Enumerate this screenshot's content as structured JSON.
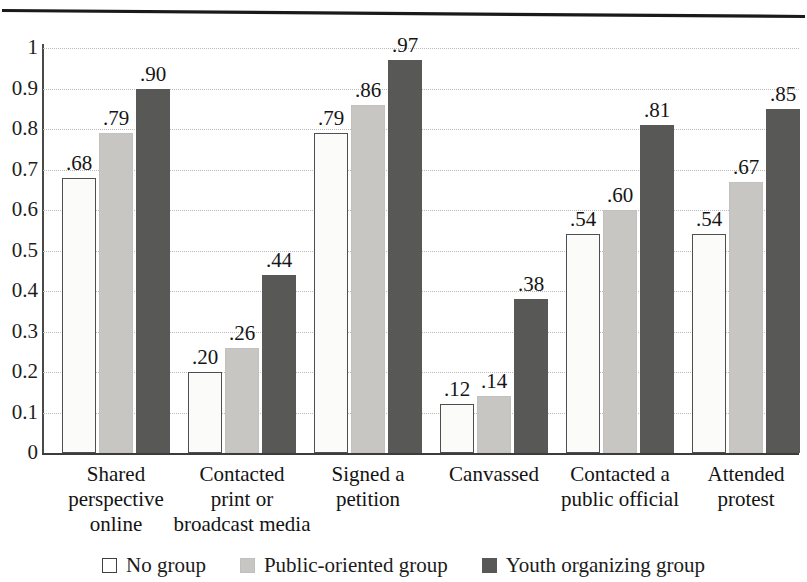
{
  "chart_data": {
    "type": "bar",
    "title": "",
    "subtitle": "",
    "xlabel": "",
    "ylabel": "",
    "ylim": [
      0,
      1
    ],
    "grid": true,
    "legend_position": "bottom",
    "categories": [
      "Shared perspective online",
      "Contacted print or broadcast media",
      "Signed a petition",
      "Canvassed",
      "Contacted a public official",
      "Attended protest"
    ],
    "category_lines": [
      [
        "Shared",
        "perspective",
        "online"
      ],
      [
        "Contacted",
        "print or",
        "broadcast media"
      ],
      [
        "Signed a",
        "petition"
      ],
      [
        "Canvassed"
      ],
      [
        "Contacted a",
        "public official"
      ],
      [
        "Attended",
        "protest"
      ]
    ],
    "series": [
      {
        "name": "No group",
        "color": "#fbfbfa",
        "values": [
          0.68,
          0.2,
          0.79,
          0.12,
          0.54,
          0.54
        ],
        "labels": [
          ".68",
          ".20",
          ".79",
          ".12",
          ".54",
          ".54"
        ]
      },
      {
        "name": "Public-oriented group",
        "color": "#c7c6c2",
        "values": [
          0.79,
          0.26,
          0.86,
          0.14,
          0.6,
          0.67
        ],
        "labels": [
          ".79",
          ".26",
          ".86",
          ".14",
          ".60",
          ".67"
        ]
      },
      {
        "name": "Youth organizing group",
        "color": "#585856",
        "values": [
          0.9,
          0.44,
          0.97,
          0.38,
          0.81,
          0.85
        ],
        "labels": [
          ".90",
          ".44",
          ".97",
          ".38",
          ".81",
          ".85"
        ]
      }
    ],
    "yticks": [
      {
        "value": 1,
        "label": "1"
      },
      {
        "value": 0.9,
        "label": "0.9"
      },
      {
        "value": 0.8,
        "label": "0.8"
      },
      {
        "value": 0.7,
        "label": "0.7"
      },
      {
        "value": 0.6,
        "label": "0.6"
      },
      {
        "value": 0.5,
        "label": "0.5"
      },
      {
        "value": 0.4,
        "label": "0.4"
      },
      {
        "value": 0.3,
        "label": "0.3"
      },
      {
        "value": 0.2,
        "label": "0.2"
      },
      {
        "value": 0.1,
        "label": "0.1"
      },
      {
        "value": 0,
        "label": "0"
      }
    ],
    "legend": [
      {
        "label": "No group",
        "swatch": "s0"
      },
      {
        "label": "Public-oriented group",
        "swatch": "s1"
      },
      {
        "label": "Youth organizing group",
        "swatch": "s2"
      }
    ]
  },
  "layout": {
    "plot_left": 43,
    "plot_top": 48,
    "plot_width": 756,
    "plot_height": 405,
    "group_count": 6,
    "bar_width": 34,
    "bar_gap": 3,
    "group_pad_left": 19
  }
}
